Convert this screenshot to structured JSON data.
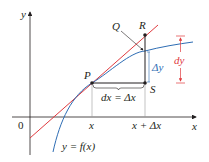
{
  "diagram": {
    "colors": {
      "axis": "#231f20",
      "tangent": "#e03a3e",
      "curve": "#2e6db4",
      "guide": "#9a9a9a",
      "dy_bracket": "#e03a3e",
      "delta_y": "#2e6db4"
    },
    "axes": {
      "y_label": "y",
      "x_label": "x",
      "origin_label": "0"
    },
    "points": {
      "P": "P",
      "Q": "Q",
      "R": "R",
      "S": "S"
    },
    "x_ticks": {
      "x": "x",
      "x_plus_dx": "x + Δx"
    },
    "labels": {
      "dx_eq": "dx = Δx",
      "delta_y": "Δy",
      "dy": "dy",
      "curve": "y = f(x)"
    }
  }
}
